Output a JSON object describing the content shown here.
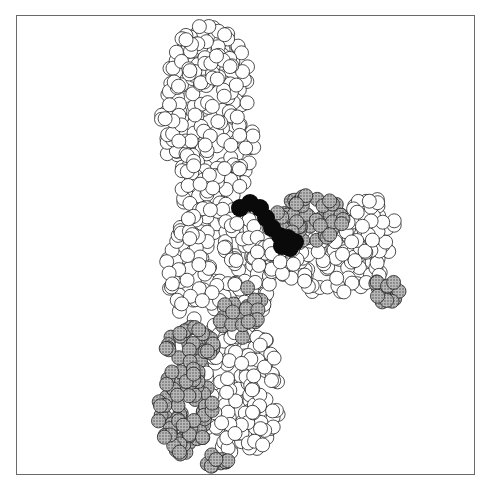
{
  "figure": {
    "type": "space-filling molecular model",
    "frame": {
      "x": 16,
      "y": 15,
      "width": 459,
      "height": 460,
      "border_color": "#6a6a6a"
    },
    "colors": {
      "atom_fill_white": "#ffffff",
      "atom_fill_gray": "#9a9a9a",
      "atom_fill_black": "#0a0a0a",
      "atom_stroke": "#222222"
    },
    "atom_radius": 7,
    "regions": [
      {
        "name": "upper-domain",
        "shade": "white",
        "shape": "ellipse",
        "cx": 208,
        "cy": 120,
        "rx": 48,
        "ry": 95,
        "count": 230,
        "seed": 11
      },
      {
        "name": "upper-domain-top",
        "shade": "white",
        "shape": "ellipse",
        "cx": 205,
        "cy": 55,
        "rx": 30,
        "ry": 30,
        "count": 40,
        "seed": 3
      },
      {
        "name": "middle-body",
        "shade": "white",
        "shape": "ellipse",
        "cx": 220,
        "cy": 270,
        "rx": 55,
        "ry": 65,
        "count": 170,
        "seed": 5
      },
      {
        "name": "right-arm",
        "shade": "white",
        "shape": "ellipse",
        "cx": 320,
        "cy": 255,
        "rx": 70,
        "ry": 40,
        "count": 140,
        "seed": 7
      },
      {
        "name": "right-arm-tip",
        "shade": "white",
        "shape": "ellipse",
        "cx": 370,
        "cy": 225,
        "rx": 25,
        "ry": 28,
        "count": 40,
        "seed": 9
      },
      {
        "name": "lower-domain",
        "shade": "white",
        "shape": "ellipse",
        "cx": 240,
        "cy": 390,
        "rx": 42,
        "ry": 68,
        "count": 160,
        "seed": 13
      },
      {
        "name": "gray-upper-right-patch",
        "shade": "gray",
        "shape": "ellipse",
        "cx": 310,
        "cy": 220,
        "rx": 35,
        "ry": 25,
        "count": 45,
        "seed": 17
      },
      {
        "name": "gray-right-tip-patch",
        "shade": "gray",
        "shape": "ellipse",
        "cx": 385,
        "cy": 290,
        "rx": 15,
        "ry": 15,
        "count": 14,
        "seed": 19
      },
      {
        "name": "gray-mid-patch",
        "shade": "gray",
        "shape": "ellipse",
        "cx": 240,
        "cy": 310,
        "rx": 22,
        "ry": 30,
        "count": 22,
        "seed": 23
      },
      {
        "name": "gray-lower-left-upper",
        "shade": "gray",
        "shape": "ellipse",
        "cx": 190,
        "cy": 345,
        "rx": 25,
        "ry": 18,
        "count": 30,
        "seed": 29
      },
      {
        "name": "gray-lower-left",
        "shade": "gray",
        "shape": "ellipse",
        "cx": 185,
        "cy": 410,
        "rx": 28,
        "ry": 45,
        "count": 80,
        "seed": 31
      },
      {
        "name": "gray-bottom-strip",
        "shade": "gray",
        "shape": "ellipse",
        "cx": 215,
        "cy": 455,
        "rx": 15,
        "ry": 12,
        "count": 10,
        "seed": 37
      }
    ],
    "ligand": {
      "name": "black-ligand",
      "shade": "black",
      "points": [
        [
          240,
          208
        ],
        [
          250,
          203
        ],
        [
          260,
          208
        ],
        [
          266,
          218
        ],
        [
          272,
          228
        ],
        [
          280,
          236
        ],
        [
          288,
          238
        ],
        [
          295,
          242
        ],
        [
          290,
          248
        ],
        [
          282,
          246
        ]
      ],
      "radius": 9
    }
  }
}
